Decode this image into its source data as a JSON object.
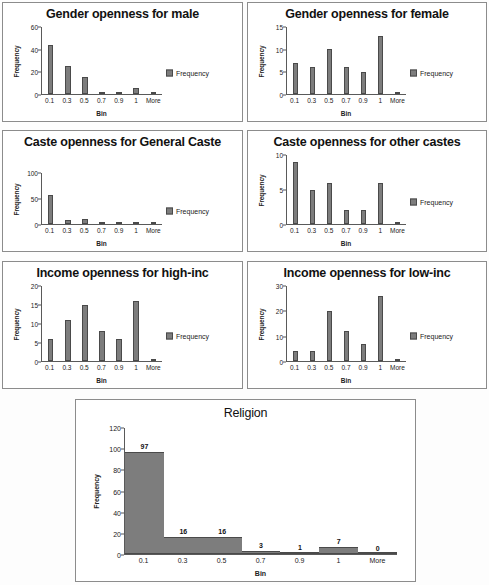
{
  "figure": {
    "background": "#fdfdfd",
    "bar_color": "#7d7d7d",
    "bar_border_color": "#4a4a4a",
    "axis_color": "#5a5a5a"
  },
  "common": {
    "xlabel": "Bin",
    "ylabel": "Frequency",
    "legend_label": "Frequency",
    "categories": [
      "0.1",
      "0.3",
      "0.5",
      "0.7",
      "0.9",
      "1",
      "More"
    ]
  },
  "chart_data": [
    {
      "id": "gender-male",
      "type": "bar",
      "title": "Gender openness for male",
      "xlabel": "Bin",
      "ylabel": "Frequency",
      "legend": [
        "Frequency"
      ],
      "legend_position": "right",
      "grid": false,
      "categories": [
        "0.1",
        "0.3",
        "0.5",
        "0.7",
        "0.9",
        "1",
        "More"
      ],
      "values": [
        44,
        25,
        15,
        1,
        1,
        5,
        0
      ],
      "ylim": [
        0,
        60
      ],
      "yticks": [
        0,
        20,
        40,
        60
      ],
      "show_value_labels": false
    },
    {
      "id": "gender-female",
      "type": "bar",
      "title": "Gender openness for female",
      "xlabel": "Bin",
      "ylabel": "Frequency",
      "legend": [
        "Frequency"
      ],
      "legend_position": "right",
      "grid": false,
      "categories": [
        "0.1",
        "0.3",
        "0.5",
        "0.7",
        "0.9",
        "1",
        "More"
      ],
      "values": [
        7,
        6,
        10,
        6,
        5,
        13,
        0
      ],
      "ylim": [
        0,
        15
      ],
      "yticks": [
        0,
        5,
        10,
        15
      ],
      "show_value_labels": false
    },
    {
      "id": "caste-general",
      "type": "bar",
      "title": "Caste openness for General Caste",
      "xlabel": "Bin",
      "ylabel": "Frequency",
      "legend": [
        "Frequency"
      ],
      "legend_position": "right",
      "grid": false,
      "categories": [
        "0.1",
        "0.3",
        "0.5",
        "0.7",
        "0.9",
        "1",
        "More"
      ],
      "values": [
        57,
        7,
        10,
        2,
        0,
        2,
        0
      ],
      "ylim": [
        0,
        100
      ],
      "yticks": [
        0,
        50,
        100
      ],
      "show_value_labels": false
    },
    {
      "id": "caste-other",
      "type": "bar",
      "title": "Caste openness for other castes",
      "xlabel": "Bin",
      "ylabel": "Frequency",
      "legend": [
        "Frequency"
      ],
      "legend_position": "right",
      "grid": false,
      "categories": [
        "0.1",
        "0.3",
        "0.5",
        "0.7",
        "0.9",
        "1",
        "More"
      ],
      "values": [
        9,
        5,
        6,
        2,
        2,
        6,
        0
      ],
      "ylim": [
        0,
        10
      ],
      "yticks": [
        0,
        5,
        10
      ],
      "show_value_labels": false
    },
    {
      "id": "income-high",
      "type": "bar",
      "title": "Income openness for high-inc",
      "xlabel": "Bin",
      "ylabel": "Frequency",
      "legend": [
        "Frequency"
      ],
      "legend_position": "right",
      "grid": false,
      "categories": [
        "0.1",
        "0.3",
        "0.5",
        "0.7",
        "0.9",
        "1",
        "More"
      ],
      "values": [
        6,
        11,
        15,
        8,
        6,
        16,
        0
      ],
      "ylim": [
        0,
        20
      ],
      "yticks": [
        0,
        5,
        10,
        15,
        20
      ],
      "show_value_labels": false
    },
    {
      "id": "income-low",
      "type": "bar",
      "title": "Income openness for low-inc",
      "xlabel": "Bin",
      "ylabel": "Frequency",
      "legend": [
        "Frequency"
      ],
      "legend_position": "right",
      "grid": false,
      "categories": [
        "0.1",
        "0.3",
        "0.5",
        "0.7",
        "0.9",
        "1",
        "More"
      ],
      "values": [
        4,
        4,
        20,
        12,
        7,
        26,
        0
      ],
      "ylim": [
        0,
        30
      ],
      "yticks": [
        0,
        10,
        20,
        30
      ],
      "show_value_labels": false
    },
    {
      "id": "religion",
      "type": "bar",
      "title": "Religion",
      "xlabel": "Bin",
      "ylabel": "Frequency",
      "legend": [],
      "legend_position": "none",
      "grid": false,
      "categories": [
        "0.1",
        "0.3",
        "0.5",
        "0.7",
        "0.9",
        "1",
        "More"
      ],
      "values": [
        97,
        16,
        16,
        3,
        1,
        7,
        0
      ],
      "ylim": [
        0,
        120
      ],
      "yticks": [
        0,
        20,
        40,
        60,
        80,
        100,
        120
      ],
      "show_value_labels": true
    }
  ]
}
